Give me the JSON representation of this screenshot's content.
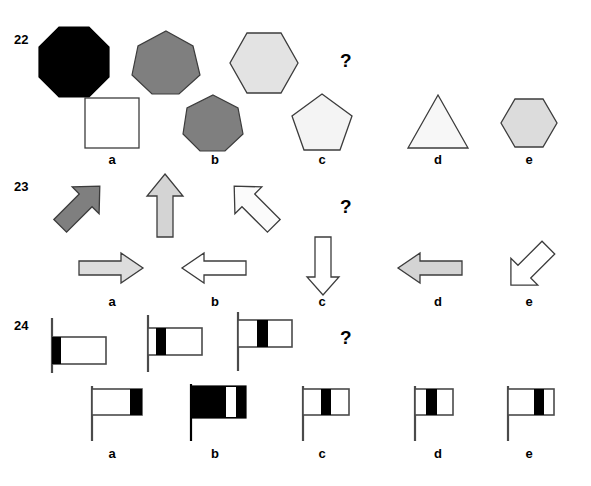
{
  "page": {
    "background_color": "#ffffff",
    "width": 591,
    "height": 486
  },
  "colors": {
    "black": "#000000",
    "dark_gray": "#7f7f7f",
    "mid_gray": "#999999",
    "light_gray": "#e3e3e3",
    "very_light_gray": "#ededed",
    "white": "#ffffff",
    "outline": "#555555"
  },
  "question_mark": "?",
  "problems": [
    {
      "id": "problem-22",
      "number": "22",
      "prompt_shapes": [
        {
          "name": "octagon",
          "sides": 8,
          "fill": "#000000",
          "label": ""
        },
        {
          "name": "heptagon",
          "sides": 7,
          "fill": "#7f7f7f",
          "label": ""
        },
        {
          "name": "hexagon",
          "sides": 6,
          "fill": "#e3e3e3",
          "label": ""
        }
      ],
      "options": [
        {
          "key": "a",
          "label": "a",
          "name": "square",
          "sides": 4,
          "fill": "#ffffff"
        },
        {
          "key": "b",
          "label": "b",
          "name": "heptagon",
          "sides": 7,
          "fill": "#7f7f7f"
        },
        {
          "key": "c",
          "label": "c",
          "name": "pentagon",
          "sides": 5,
          "fill": "#f4f4f4"
        },
        {
          "key": "d",
          "label": "d",
          "name": "triangle",
          "sides": 3,
          "fill": "#f7f7f7"
        },
        {
          "key": "e",
          "label": "e",
          "name": "hexagon",
          "sides": 6,
          "fill": "#dcdcdc"
        }
      ]
    },
    {
      "id": "problem-23",
      "number": "23",
      "prompt_shapes": [
        {
          "name": "arrow-up-right",
          "direction": "up-right",
          "fill": "#7f7f7f",
          "label": ""
        },
        {
          "name": "arrow-up",
          "direction": "up",
          "fill": "#d4d4d4",
          "label": ""
        },
        {
          "name": "arrow-up-left",
          "direction": "up-left",
          "fill": "#fbfbfb",
          "label": ""
        }
      ],
      "options": [
        {
          "key": "a",
          "label": "a",
          "name": "arrow-right",
          "direction": "right",
          "fill": "#dddddd"
        },
        {
          "key": "b",
          "label": "b",
          "name": "arrow-left",
          "direction": "left",
          "fill": "#ffffff"
        },
        {
          "key": "c",
          "label": "c",
          "name": "arrow-down",
          "direction": "down",
          "fill": "#ffffff"
        },
        {
          "key": "d",
          "label": "d",
          "name": "arrow-left",
          "direction": "left",
          "fill": "#d4d4d4"
        },
        {
          "key": "e",
          "label": "e",
          "name": "arrow-down-left",
          "direction": "down-left",
          "fill": "#ffffff"
        }
      ]
    },
    {
      "id": "problem-24",
      "number": "24",
      "prompt_shapes": [
        {
          "name": "flag-band-left",
          "band_position": 0.0,
          "band_width": 0.18,
          "flag_height_on_pole": "low",
          "label": ""
        },
        {
          "name": "flag-band-near-left",
          "band_position": 0.1,
          "band_width": 0.18,
          "flag_height_on_pole": "mid",
          "label": ""
        },
        {
          "name": "flag-band-center",
          "band_position": 0.3,
          "band_width": 0.18,
          "flag_height_on_pole": "high",
          "label": ""
        }
      ],
      "options": [
        {
          "key": "a",
          "label": "a",
          "name": "flag-band-right-edge",
          "band_position": 0.78,
          "band_width": 0.2
        },
        {
          "key": "b",
          "label": "b",
          "name": "flag-mostly-black-white-band",
          "band_position": 0.62,
          "band_width": 0.16,
          "inverted": true
        },
        {
          "key": "c",
          "label": "c",
          "name": "flag-band-right-of-center",
          "band_position": 0.34,
          "band_width": 0.2
        },
        {
          "key": "d",
          "label": "d",
          "name": "flag-band-left-of-center",
          "band_position": 0.3,
          "band_width": 0.26
        },
        {
          "key": "e",
          "label": "e",
          "name": "flag-band-right-of-center-wide",
          "band_position": 0.5,
          "band_width": 0.2
        }
      ]
    }
  ]
}
